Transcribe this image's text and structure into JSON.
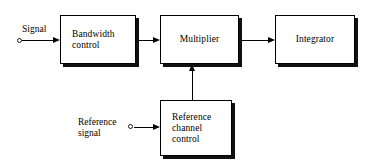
{
  "diagram": {
    "background_color": "#ffffff",
    "line_color": "#000000",
    "block_fill_color": "#ffffff",
    "shadow_color": "#111111",
    "blocks": [
      {
        "id": "bandwidth",
        "label": "Bandwidth\ncontrol",
        "align": "left"
      },
      {
        "id": "multiplier",
        "label": "Multiplier",
        "align": "center"
      },
      {
        "id": "integrator",
        "label": "Integrator",
        "align": "center"
      },
      {
        "id": "reference_channel",
        "label": "Reference\nchannel\ncontrol",
        "align": "left"
      }
    ],
    "terminals": [
      {
        "id": "signal",
        "label": "Signal"
      },
      {
        "id": "reference_signal",
        "label": "Reference\nsignal"
      }
    ],
    "connections": [
      {
        "id": "signal-to-bandwidth",
        "from": "signal",
        "to": "bandwidth",
        "direction": "right"
      },
      {
        "id": "bandwidth-to-multiplier",
        "from": "bandwidth",
        "to": "multiplier",
        "direction": "right"
      },
      {
        "id": "multiplier-to-integrator",
        "from": "multiplier",
        "to": "integrator",
        "direction": "right"
      },
      {
        "id": "reference-signal-to-reference-channel",
        "from": "reference_signal",
        "to": "reference_channel",
        "direction": "right"
      },
      {
        "id": "reference-channel-to-multiplier",
        "from": "reference_channel",
        "to": "multiplier",
        "direction": "up"
      }
    ]
  }
}
